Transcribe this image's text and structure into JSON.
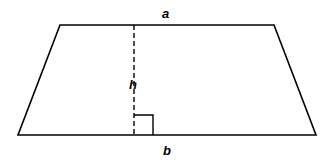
{
  "diagram": {
    "labels": {
      "top_base": "a",
      "height": "h",
      "bottom_base": "b"
    },
    "stroke_color": "#000000",
    "background": "#ffffff"
  }
}
